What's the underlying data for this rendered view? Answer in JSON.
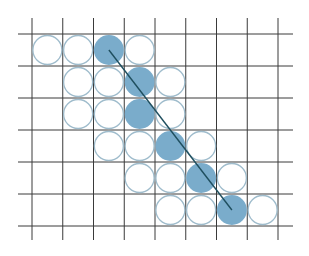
{
  "diagram": {
    "type": "pixel-grid-line-rasterization",
    "grid": {
      "columns": 8,
      "rows": 6,
      "x_lines": [
        32,
        62.75,
        93.5,
        124.25,
        155,
        185.75,
        216.5,
        247.25,
        278
      ],
      "y_lines": [
        34,
        66,
        98,
        130,
        162,
        194,
        226
      ],
      "extent": {
        "x_min": 18,
        "x_max": 293,
        "y_min": 18,
        "y_max": 240
      },
      "line_color": "#3a3a3a"
    },
    "circles": [
      {
        "row": 0,
        "col": 0,
        "filled": false
      },
      {
        "row": 0,
        "col": 1,
        "filled": false
      },
      {
        "row": 0,
        "col": 2,
        "filled": true
      },
      {
        "row": 0,
        "col": 3,
        "filled": false
      },
      {
        "row": 1,
        "col": 1,
        "filled": false
      },
      {
        "row": 1,
        "col": 2,
        "filled": false
      },
      {
        "row": 1,
        "col": 3,
        "filled": true
      },
      {
        "row": 1,
        "col": 4,
        "filled": false
      },
      {
        "row": 2,
        "col": 1,
        "filled": false
      },
      {
        "row": 2,
        "col": 2,
        "filled": false
      },
      {
        "row": 2,
        "col": 3,
        "filled": true
      },
      {
        "row": 2,
        "col": 4,
        "filled": false
      },
      {
        "row": 3,
        "col": 2,
        "filled": false
      },
      {
        "row": 3,
        "col": 3,
        "filled": false
      },
      {
        "row": 3,
        "col": 4,
        "filled": true
      },
      {
        "row": 3,
        "col": 5,
        "filled": false
      },
      {
        "row": 4,
        "col": 3,
        "filled": false
      },
      {
        "row": 4,
        "col": 4,
        "filled": false
      },
      {
        "row": 4,
        "col": 5,
        "filled": true
      },
      {
        "row": 4,
        "col": 6,
        "filled": false
      },
      {
        "row": 5,
        "col": 4,
        "filled": false
      },
      {
        "row": 5,
        "col": 5,
        "filled": false
      },
      {
        "row": 5,
        "col": 6,
        "filled": true
      },
      {
        "row": 5,
        "col": 7,
        "filled": false
      }
    ],
    "segment": {
      "from": {
        "row": 0,
        "col": 2
      },
      "to": {
        "row": 5,
        "col": 6
      },
      "color": "#1f4f5f"
    },
    "colors": {
      "filled_circle": "#7aaccb",
      "empty_circle_stroke": "#9fbccc",
      "empty_circle_fill": "#ffffff",
      "background": "#ffffff"
    }
  }
}
